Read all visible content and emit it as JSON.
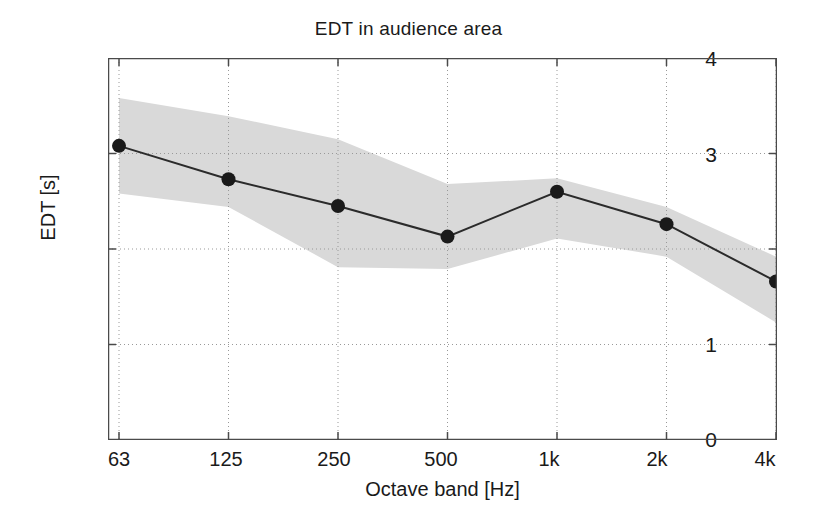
{
  "chart_data": {
    "type": "line",
    "title": "EDT in audience area",
    "xlabel": "Octave band [Hz]",
    "ylabel": "EDT [s]",
    "categories": [
      "63",
      "125",
      "250",
      "500",
      "1k",
      "2k",
      "4k"
    ],
    "xtick_labels": [
      "63",
      "125",
      "250",
      "500",
      "1k",
      "2k",
      "4k"
    ],
    "ytick_labels": [
      "0",
      "1",
      "2",
      "3",
      "4"
    ],
    "ytick_values": [
      0,
      1,
      2,
      3,
      4
    ],
    "ylim": [
      0,
      4
    ],
    "grid": "dotted",
    "legend": "none",
    "series": [
      {
        "name": "EDT mean",
        "marker": "filled-circle",
        "color": "#1a1a1a",
        "values": [
          3.08,
          2.73,
          2.45,
          2.13,
          2.6,
          2.26,
          1.66
        ]
      },
      {
        "name": "EDT range band",
        "type": "area",
        "color": "#d9d9d9",
        "upper": [
          3.58,
          3.39,
          3.15,
          2.68,
          2.74,
          2.44,
          1.92
        ],
        "lower": [
          2.58,
          2.44,
          1.81,
          1.79,
          2.11,
          1.92,
          1.23
        ]
      }
    ]
  },
  "colors": {
    "band_fill": "#d9d9d9",
    "line": "#2b2b2b",
    "axis": "#4a4a4a",
    "grid": "#999999",
    "text": "#1a1a1a"
  }
}
